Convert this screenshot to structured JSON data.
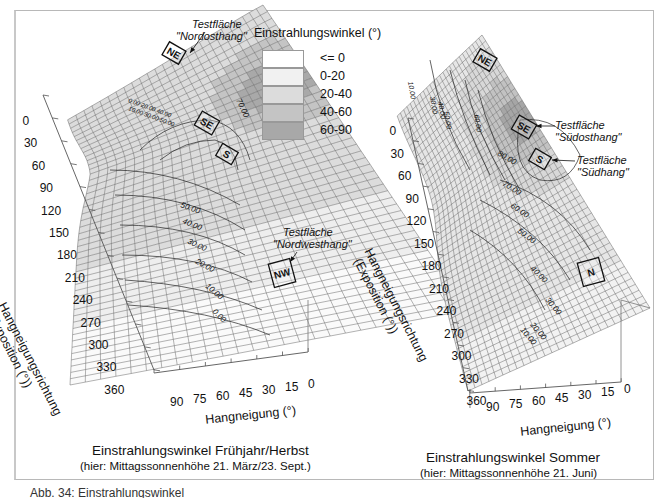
{
  "legend": {
    "title": "Einstrahlungswinkel (°)",
    "items": [
      {
        "label": "<= 0",
        "color": "#ffffff"
      },
      {
        "label": "0-20",
        "color": "#f1f1f1"
      },
      {
        "label": "20-40",
        "color": "#dcdcdc"
      },
      {
        "label": "40-60",
        "color": "#c4c4c4"
      },
      {
        "label": "60-90",
        "color": "#a8a8a8"
      }
    ]
  },
  "chart_data": [
    {
      "type": "surface3d",
      "title": "Einstrahlungswinkel Frühjahr/Herbst",
      "subtitle": "(hier: Mittagssonnenhöhe 21. März/23. Sept.)",
      "xlabel": "Hangneigung (°)",
      "ylabel": "Hangneigungsrichtung (Exposition (°))",
      "x_ticks": [
        90,
        75,
        60,
        45,
        30,
        15,
        0
      ],
      "y_ticks": [
        0,
        30,
        60,
        90,
        120,
        150,
        180,
        210,
        240,
        270,
        300,
        330,
        360
      ],
      "contour_labels": [
        "0.00",
        "10.00",
        "20.00",
        "30.00",
        "40.00",
        "50.00",
        "60.00",
        "70.00"
      ],
      "legend_classes": [
        "<= 0",
        "0-20",
        "20-40",
        "40-60",
        "60-90"
      ],
      "markers": [
        {
          "label": "NE",
          "annotation": "Testfläche \"Nordosthang\""
        },
        {
          "label": "SE",
          "annotation": ""
        },
        {
          "label": "S",
          "annotation": ""
        },
        {
          "label": "NW",
          "annotation": "Testfläche \"Nordwesthang\""
        }
      ]
    },
    {
      "type": "surface3d",
      "title": "Einstrahlungswinkel Sommer",
      "subtitle": "(hier: Mittagssonnenhöhe  21. Juni)",
      "xlabel": "Hangneigung (°)",
      "ylabel": "Hangneigungsrichtung (Exposition (°))",
      "x_ticks": [
        90,
        75,
        60,
        45,
        30,
        15,
        0
      ],
      "y_ticks": [
        0,
        30,
        60,
        90,
        120,
        150,
        180,
        210,
        240,
        270,
        300,
        330,
        360
      ],
      "contour_labels": [
        "10.00",
        "20.00",
        "30.00",
        "40.00",
        "50.00",
        "60.00",
        "70.00",
        "80.00"
      ],
      "legend_classes": [
        "<= 0",
        "0-20",
        "20-40",
        "40-60",
        "60-90"
      ],
      "markers": [
        {
          "label": "NE",
          "annotation": ""
        },
        {
          "label": "SE",
          "annotation": "Testfläche \"Südosthang\""
        },
        {
          "label": "S",
          "annotation": "Testfläche \"Südhang\""
        },
        {
          "label": "N",
          "annotation": ""
        }
      ]
    }
  ],
  "left": {
    "title": "Einstrahlungswinkel Frühjahr/Herbst",
    "subtitle": "(hier: Mittagssonnenhöhe 21. März/23. Sept.)",
    "xlabel": "Hangneigung (°)",
    "ylabel1": "Hangneigungsrichtung",
    "ylabel2": "(Exposition (°))",
    "ann_ne1": "Testfläche",
    "ann_ne2": "\"Nordosthang\"",
    "ann_nw1": "Testfläche",
    "ann_nw2": "\"Nordwesthang\"",
    "m_ne": "NE",
    "m_se": "SE",
    "m_s": "S",
    "m_nw": "NW"
  },
  "right": {
    "title": "Einstrahlungswinkel Sommer",
    "subtitle": "(hier: Mittagssonnenhöhe  21. Juni)",
    "xlabel": "Hangneigung (°)",
    "ylabel1": "Hangneigungsrichtung",
    "ylabel2": "(Exposition (°))",
    "ann_se1": "Testfläche",
    "ann_se2": "\"Südosthang\"",
    "ann_s1": "Testfläche",
    "ann_s2": "\"Südhang\"",
    "m_ne": "NE",
    "m_se": "SE",
    "m_s": "S",
    "m_n": "N"
  },
  "yticks": [
    "0",
    "30",
    "60",
    "90",
    "120",
    "150",
    "180",
    "210",
    "240",
    "270",
    "300",
    "330",
    "360"
  ],
  "xticks": [
    "90",
    "75",
    "60",
    "45",
    "30",
    "15",
    "0"
  ],
  "footer": "Abb. 34: Einstrahlungswinkel"
}
